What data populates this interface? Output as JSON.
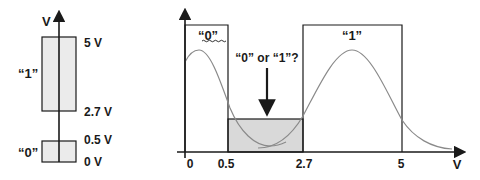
{
  "left_diagram": {
    "axis_label": "V",
    "levels": [
      {
        "label": "5 V",
        "value": 5
      },
      {
        "label": "2.7 V",
        "value": 2.7
      },
      {
        "label": "0.5 V",
        "value": 0.5
      },
      {
        "label": "0 V",
        "value": 0
      }
    ],
    "ranges": [
      {
        "name": "logic-1",
        "label": "“1”",
        "low": 2.7,
        "high": 5
      },
      {
        "name": "logic-0",
        "label": "“0”",
        "low": 0,
        "high": 0.5
      }
    ]
  },
  "right_diagram": {
    "x_axis_label": "V",
    "x_ticks": [
      "0",
      "0.5",
      "2.7",
      "5"
    ],
    "region_0_label": "“0”",
    "region_1_label": "“1”",
    "ambiguous_label": "“0” or “1”?",
    "regions": [
      {
        "name": "logic-0",
        "from": 0,
        "to": 0.5
      },
      {
        "name": "undefined",
        "from": 0.5,
        "to": 2.7
      },
      {
        "name": "logic-1",
        "from": 2.7,
        "to": 5
      }
    ]
  },
  "colors": {
    "line": "#1a1a1a",
    "box_fill": "#ebebeb",
    "shaded_fill": "#d9d9d9",
    "curve": "#8a8a8a"
  }
}
